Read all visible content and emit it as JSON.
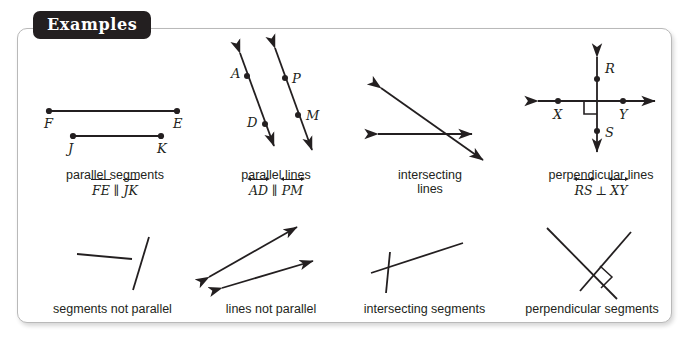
{
  "panel": {
    "tab_label": "Examples",
    "border_color": "#b9b9b9",
    "tab_bg": "#231f20",
    "ink": "#231f20",
    "background": "#ffffff"
  },
  "figures": {
    "top_row": [
      {
        "id": "parallel-segments",
        "caption": "parallel segments",
        "notation": {
          "left": "FE",
          "relation": "∥",
          "right": "JK",
          "bar_style": "segment"
        },
        "point_labels": [
          "F",
          "E",
          "J",
          "K"
        ]
      },
      {
        "id": "parallel-lines",
        "caption": "parallel lines",
        "notation": {
          "left": "AD",
          "relation": "∥",
          "right": "PM",
          "bar_style": "line"
        },
        "point_labels": [
          "A",
          "D",
          "P",
          "M"
        ]
      },
      {
        "id": "intersecting-lines",
        "caption": "intersecting",
        "caption_line2": "lines",
        "notation": null,
        "point_labels": []
      },
      {
        "id": "perpendicular-lines",
        "caption": "perpendicular lines",
        "notation": {
          "left": "RS",
          "relation": "⊥",
          "right": "XY",
          "bar_style": "line"
        },
        "point_labels": [
          "R",
          "S",
          "X",
          "Y"
        ]
      }
    ],
    "bottom_row": [
      {
        "id": "segments-not-parallel",
        "caption": "segments not parallel"
      },
      {
        "id": "lines-not-parallel",
        "caption": "lines not parallel"
      },
      {
        "id": "intersecting-segments",
        "caption": "intersecting segments"
      },
      {
        "id": "perpendicular-segments",
        "caption": "perpendicular segments"
      }
    ]
  }
}
